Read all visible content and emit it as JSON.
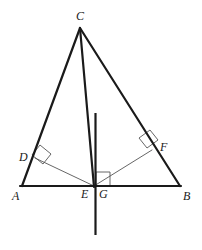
{
  "figure": {
    "background_color": "#ffffff",
    "stroke_color": "#1a1a1a",
    "thin_stroke_color": "#555555",
    "thick_width": 2.2,
    "thin_width": 0.9,
    "width": 202,
    "height": 250
  },
  "points": {
    "A": {
      "label": "A",
      "x": 22,
      "y": 186,
      "label_x": 12,
      "label_y": 190
    },
    "B": {
      "label": "B",
      "x": 180,
      "y": 186,
      "label_x": 183,
      "label_y": 190
    },
    "C": {
      "label": "C",
      "x": 80,
      "y": 28,
      "label_x": 76,
      "label_y": 10
    },
    "D": {
      "label": "D",
      "x": 35,
      "y": 158,
      "label_x": 19,
      "label_y": 151
    },
    "E": {
      "label": "E",
      "x": 94,
      "y": 186,
      "label_x": 81,
      "label_y": 188
    },
    "F": {
      "label": "F",
      "x": 152,
      "y": 150,
      "label_x": 160,
      "label_y": 141
    },
    "G": {
      "label": "G",
      "x": 96,
      "y": 186,
      "label_x": 99,
      "label_y": 188
    }
  },
  "segments": [
    {
      "name": "side-ab",
      "from": "A",
      "to": "B",
      "weight": "thick"
    },
    {
      "name": "side-ac",
      "from": "A",
      "to": "C",
      "weight": "thick"
    },
    {
      "name": "side-cb",
      "from": "C",
      "to": "B",
      "weight": "thick"
    },
    {
      "name": "cevian-ce",
      "from": "C",
      "to": "E",
      "weight": "thick"
    },
    {
      "name": "perpendicular-ed",
      "from": "E",
      "to": "D",
      "weight": "thin"
    },
    {
      "name": "perpendicular-ef",
      "from": "E",
      "to": "F",
      "weight": "thin"
    }
  ],
  "vertical_line": {
    "name": "vertical-line-through-g",
    "x": 95.5,
    "y_top": 113,
    "y_bottom": 235,
    "weight": "thick"
  },
  "right_angle_marks": [
    {
      "name": "right-angle-at-d",
      "points": "40,145 51,154 43,164 32,155",
      "style": "thin"
    },
    {
      "name": "right-angle-at-f",
      "points": "139,138 150,130 158,140 147,148",
      "style": "thin"
    },
    {
      "name": "right-angle-at-g",
      "points": "96,172 110,172 110,186 96,186",
      "style": "thin"
    }
  ]
}
